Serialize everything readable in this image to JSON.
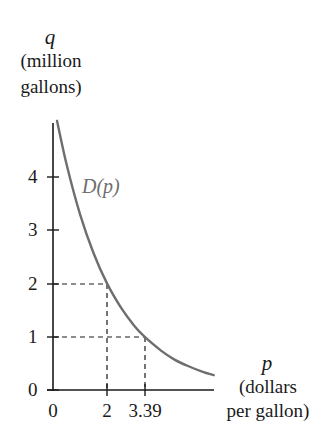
{
  "chart_data": {
    "type": "line",
    "title": "",
    "ylabel": {
      "symbol": "q",
      "line1": "(million",
      "line2": "gallons)"
    },
    "xlabel": {
      "symbol": "p",
      "line1": "(dollars",
      "line2": "per gallon)"
    },
    "x_ticks": [
      "0",
      "2",
      "3.39"
    ],
    "y_ticks": [
      "0",
      "1",
      "2",
      "3",
      "4"
    ],
    "series": [
      {
        "name": "D(p)",
        "label": "D(p)",
        "color": "#6e6e6e",
        "x": [
          0.15,
          0.5,
          1.0,
          1.5,
          2.0,
          2.5,
          3.0,
          3.39,
          4.0,
          4.5,
          5.0,
          5.5,
          5.95
        ],
        "y": [
          5.05,
          4.24,
          3.3,
          2.57,
          2.0,
          1.56,
          1.21,
          1.0,
          0.74,
          0.57,
          0.45,
          0.35,
          0.28
        ]
      }
    ],
    "annotations": [
      {
        "type": "dashed-guide",
        "x": 2,
        "y": 2
      },
      {
        "type": "dashed-guide",
        "x": 3.39,
        "y": 1
      }
    ],
    "xlim": [
      0,
      6
    ],
    "ylim": [
      0,
      5
    ],
    "grid": false,
    "legend": "none"
  }
}
